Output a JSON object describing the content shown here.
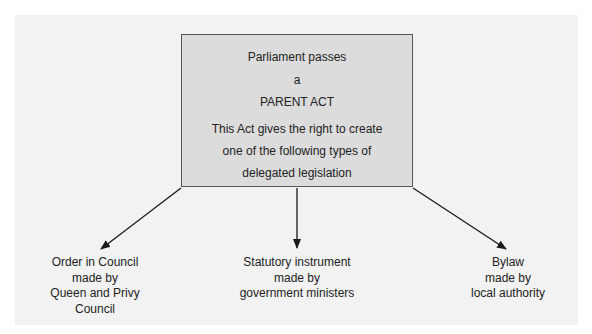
{
  "parent_box": {
    "lines": [
      "Parliament passes",
      "a",
      "PARENT ACT",
      "This Act gives the right to create",
      "one of the following types of",
      "delegated legislation"
    ]
  },
  "children": [
    {
      "lines": [
        "Order in Council",
        "made by",
        "Queen and Privy",
        "Council"
      ]
    },
    {
      "lines": [
        "Statutory instrument",
        "made by",
        "government ministers"
      ]
    },
    {
      "lines": [
        "Bylaw",
        "made by",
        "local authority"
      ]
    }
  ],
  "colors": {
    "panel": "#f2f2f2",
    "box": "#dcdcdc",
    "border": "#555555",
    "arrow": "#1a1a1a"
  }
}
